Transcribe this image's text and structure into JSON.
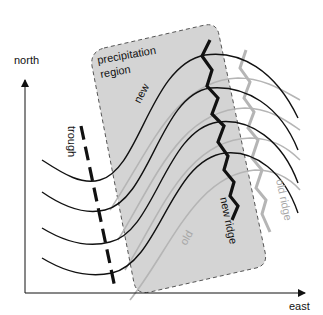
{
  "diagram": {
    "axes": {
      "y_label": "north",
      "x_label": "east"
    },
    "region": {
      "label_line1": "precipitation",
      "label_line2": "region",
      "fill": "#d4d4d4",
      "border": "#555555"
    },
    "labels": {
      "trough": "trough",
      "new": "new",
      "old": "old",
      "new_ridge": "new ridge",
      "old_ridge": "old ridge"
    },
    "colors": {
      "new_lines": "#111111",
      "old_lines": "#b5b5b5",
      "background": "#ffffff"
    },
    "contour_count": 4
  }
}
